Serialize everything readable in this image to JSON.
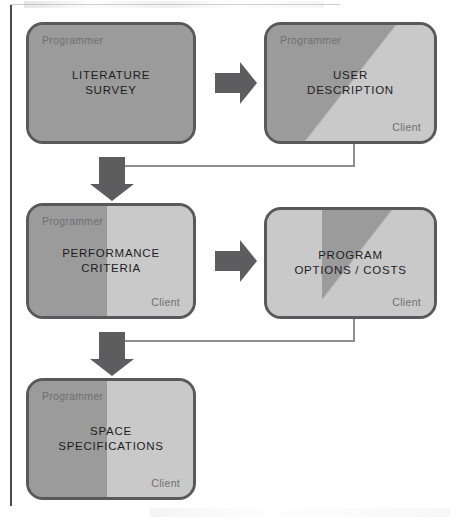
{
  "diagram": {
    "roles": {
      "programmer": "Programmer",
      "client": "Client"
    },
    "colors": {
      "programmer_fill": "#9b9b9b",
      "client_fill": "#c9c9c9",
      "node_border": "#59595b",
      "arrow_fill": "#5d5d5f",
      "connector_line": "#8f8f91",
      "title_text": "#1d1d1f",
      "role_text": "#6f6f71",
      "page_background": "#ffffff"
    },
    "nodes": [
      {
        "id": "literature-survey",
        "title": "LITERATURE\nSURVEY",
        "programmer_label": "Programmer",
        "client_label": "",
        "split": "none",
        "programmer_share": "100%",
        "client_share": "0%"
      },
      {
        "id": "user-description",
        "title": "USER\nDESCRIPTION",
        "programmer_label": "Programmer",
        "client_label": "Client",
        "split": "diagonal",
        "programmer_share": "upper-left",
        "client_share": "lower-right"
      },
      {
        "id": "performance-criteria",
        "title": "PERFORMANCE\nCRITERIA",
        "programmer_label": "Programmer",
        "client_label": "Client",
        "split": "vertical",
        "programmer_share": "left",
        "client_share": "right"
      },
      {
        "id": "program-options-costs",
        "title": "PROGRAM\nOPTIONS / COSTS",
        "programmer_label": "",
        "client_label": "Client",
        "split": "diagonal-band",
        "programmer_share": "centre band",
        "client_share": "left and upper-right"
      },
      {
        "id": "space-specifications",
        "title": "SPACE\nSPECIFICATIONS",
        "programmer_label": "Programmer",
        "client_label": "Client",
        "split": "vertical",
        "programmer_share": "left",
        "client_share": "right"
      }
    ],
    "connectors": [
      {
        "id": "survey-to-description",
        "from": "literature-survey",
        "to": "user-description",
        "style": "block-arrow",
        "direction": "right"
      },
      {
        "id": "description-to-criteria",
        "from": "user-description",
        "to": "performance-criteria",
        "style": "elbow-line-with-block-arrow",
        "direction": "down"
      },
      {
        "id": "criteria-to-options",
        "from": "performance-criteria",
        "to": "program-options-costs",
        "style": "block-arrow",
        "direction": "right"
      },
      {
        "id": "options-to-specifications",
        "from": "program-options-costs",
        "to": "space-specifications",
        "style": "elbow-line-with-block-arrow",
        "direction": "down"
      }
    ]
  }
}
